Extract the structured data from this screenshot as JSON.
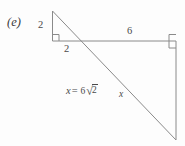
{
  "figure": {
    "part_label": "(e)",
    "background_color": "#fdfdfd",
    "stroke_color": "#8a8a8a",
    "text_color": "#4a4a4a",
    "labels": {
      "vertical_small_leg": "2",
      "horizontal_small_leg": "2",
      "top_long_leg": "6",
      "hypotenuse_var": "x"
    },
    "equation": {
      "variable": "x",
      "equals": "=",
      "coefficient": "6",
      "radical_sign": "√",
      "radicand": "2",
      "full_text": "x = 6√2"
    },
    "geometry": {
      "small_triangle_apex": "(52, 11)",
      "small_triangle_right_angle": "(53, 40)",
      "horizontal_line_right_end": "(176, 41)",
      "large_right_angle": "(176, 41)",
      "diagonal_bottom_end": "(176, 140)",
      "right_angle_marker_small": "square",
      "right_angle_marker_large": "square"
    }
  }
}
